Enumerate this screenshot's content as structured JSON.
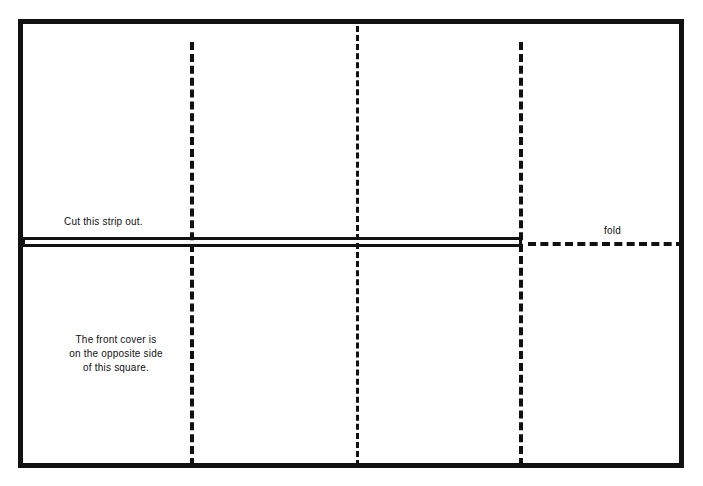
{
  "diagram": {
    "background_color": "#ffffff",
    "ink_color": "#111111",
    "outline": {
      "style": "solid",
      "border_width_px": 5
    },
    "labels": {
      "cut_strip": "Cut this strip out.",
      "front_cover": {
        "line1": "The front cover is",
        "line2": "on the opposite side",
        "line3": "of this square."
      },
      "fold": "fold"
    },
    "fold_lines": [
      {
        "name": "vertical-fold-left",
        "orientation": "vertical",
        "style": "dashed"
      },
      {
        "name": "vertical-fold-center",
        "orientation": "vertical",
        "style": "dashed"
      },
      {
        "name": "vertical-fold-right",
        "orientation": "vertical",
        "style": "dashed"
      },
      {
        "name": "horizontal-fold-right",
        "orientation": "horizontal",
        "style": "dashed"
      }
    ],
    "cut_lines": [
      {
        "name": "cut-rule-top",
        "orientation": "horizontal",
        "style": "solid"
      },
      {
        "name": "cut-rule-bottom",
        "orientation": "horizontal",
        "style": "solid"
      }
    ]
  }
}
